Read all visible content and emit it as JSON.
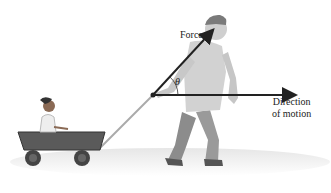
{
  "diagram": {
    "labels": {
      "force": "Force",
      "angle": "θ",
      "direction_line1": "Direction",
      "direction_line2": "of motion"
    },
    "figures": [
      "man-pulling-wagon",
      "child-in-wagon",
      "wagon"
    ],
    "vectors": [
      {
        "name": "force-vector",
        "from": [
          153,
          95
        ],
        "to": [
          213,
          30
        ],
        "color": "#222222"
      },
      {
        "name": "motion-vector",
        "from": [
          153,
          95
        ],
        "to": [
          296,
          95
        ],
        "color": "#222222"
      }
    ]
  }
}
